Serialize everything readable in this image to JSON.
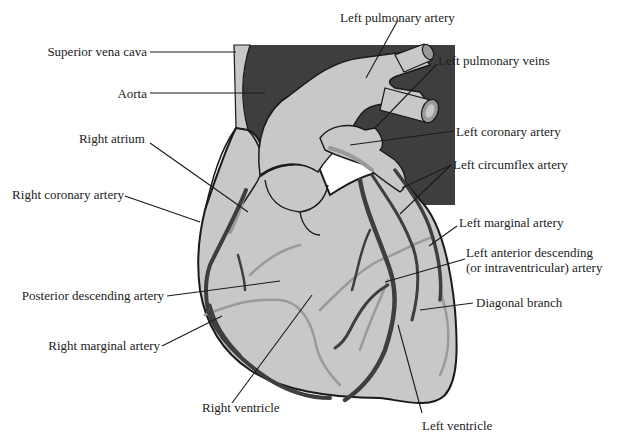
{
  "diagram": {
    "colors": {
      "background": "#ffffff",
      "heart_fill": "#c8c8c8",
      "dark_vessel": "#3e3e3e",
      "outline": "#1a1a1a",
      "artery_dark": "#444444",
      "artery_light": "#9a9a9a",
      "label_text": "#222222"
    },
    "labels": [
      {
        "id": "superior-vena-cava",
        "text": "Superior vena cava"
      },
      {
        "id": "aorta",
        "text": "Aorta"
      },
      {
        "id": "right-atrium",
        "text": "Right atrium"
      },
      {
        "id": "right-coronary-artery",
        "text": "Right coronary artery"
      },
      {
        "id": "posterior-descending-artery",
        "text": "Posterior descending artery"
      },
      {
        "id": "right-marginal-artery",
        "text": "Right marginal artery"
      },
      {
        "id": "right-ventricle",
        "text": "Right ventricle"
      },
      {
        "id": "left-pulmonary-artery",
        "text": "Left pulmonary artery"
      },
      {
        "id": "left-pulmonary-veins",
        "text": "Left pulmonary veins"
      },
      {
        "id": "left-coronary-artery",
        "text": "Left coronary artery"
      },
      {
        "id": "left-circumflex-artery",
        "text": "Left circumflex artery"
      },
      {
        "id": "left-marginal-artery",
        "text": "Left marginal artery"
      },
      {
        "id": "left-anterior-descending-1",
        "text": "Left anterior descending"
      },
      {
        "id": "left-anterior-descending-2",
        "text": "(or intraventricular) artery"
      },
      {
        "id": "diagonal-branch",
        "text": "Diagonal branch"
      },
      {
        "id": "left-ventricle",
        "text": "Left ventricle"
      }
    ]
  }
}
